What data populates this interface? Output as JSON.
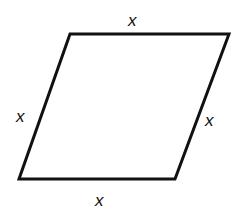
{
  "figure": {
    "type": "rhombus",
    "stroke_color": "#111111",
    "vertices": {
      "top_left": [
        70,
        34
      ],
      "top_right": [
        229,
        34
      ],
      "bottom_right": [
        175,
        179
      ],
      "bottom_left": [
        19,
        179
      ]
    },
    "labels": {
      "top": "x",
      "left": "x",
      "right": "x",
      "bottom": "x"
    }
  }
}
